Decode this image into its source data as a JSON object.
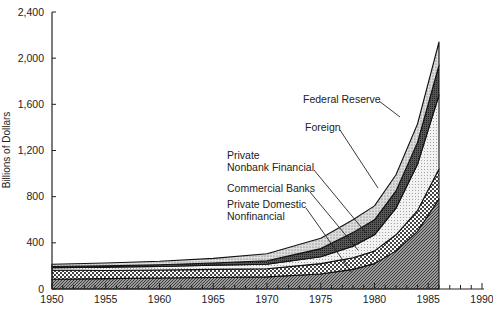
{
  "chart_data": {
    "type": "area",
    "stacked": true,
    "title": "",
    "xlabel": "",
    "ylabel": "Billions of Dollars",
    "ylim": [
      0,
      2400
    ],
    "xlim": [
      1950,
      1990
    ],
    "grid": false,
    "y_ticks": [
      "0",
      "400",
      "800",
      "1,200",
      "1,600",
      "2,000",
      "2,400"
    ],
    "y_tick_values": [
      0,
      400,
      800,
      1200,
      1600,
      2000,
      2400
    ],
    "x_ticks": [
      "1950",
      "1955",
      "1960",
      "1965",
      "1970",
      "1975",
      "1980",
      "1985",
      "1990"
    ],
    "x_tick_values": [
      1950,
      1955,
      1960,
      1965,
      1970,
      1975,
      1980,
      1985,
      1990
    ],
    "x": [
      1950,
      1955,
      1960,
      1965,
      1970,
      1975,
      1978,
      1980,
      1982,
      1984,
      1986
    ],
    "series": [
      {
        "name": "Private Domestic Nonfinancial",
        "values": [
          85,
          90,
          95,
          100,
          105,
          130,
          170,
          220,
          330,
          500,
          780
        ]
      },
      {
        "name": "Commercial Banks",
        "values": [
          80,
          70,
          70,
          70,
          70,
          90,
          100,
          110,
          140,
          180,
          260
        ]
      },
      {
        "name": "Private Nonbank Financial",
        "values": [
          20,
          30,
          30,
          35,
          40,
          60,
          100,
          140,
          230,
          400,
          640
        ]
      },
      {
        "name": "Foreign",
        "values": [
          10,
          10,
          15,
          20,
          30,
          70,
          120,
          130,
          150,
          190,
          260
        ]
      },
      {
        "name": "Federal Reserve",
        "values": [
          20,
          25,
          30,
          40,
          60,
          90,
          110,
          120,
          140,
          160,
          200
        ]
      }
    ],
    "annotations": [
      {
        "label": "Federal Reserve"
      },
      {
        "label": "Foreign"
      },
      {
        "label": "Private Nonbank Financial"
      },
      {
        "label": "Commercial Banks"
      },
      {
        "label": "Private Domestic Nonfinancial"
      }
    ],
    "legend_position": "inline-annotations"
  },
  "labels": {
    "ylabel": "Billions of Dollars",
    "fed": "Federal Reserve",
    "foreign": "Foreign",
    "nonbank_1": "Private",
    "nonbank_2": "Nonbank Financial",
    "banks": "Commercial Banks",
    "pdn_1": "Private Domestic",
    "pdn_2": "Nonfinancial"
  }
}
